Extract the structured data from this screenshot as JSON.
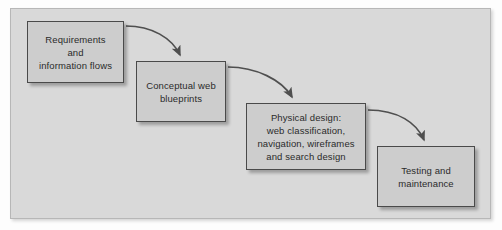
{
  "diagram": {
    "type": "flowchart",
    "frame": {
      "background_color": "#d9d9d9",
      "border_color": "#b7b7b7"
    },
    "node_style": {
      "fill_color": "#cdcdcd",
      "border_color": "#4a4a4a",
      "text_color": "#2b2b2b"
    },
    "arrow_color": "#4f4f4f",
    "nodes": [
      {
        "id": "requirements",
        "label": "Requirements\nand\ninformation flows",
        "order": 1
      },
      {
        "id": "blueprints",
        "label": "Conceptual web\nblueprints",
        "order": 2
      },
      {
        "id": "physical-design",
        "label": "Physical design:\nweb classification,\nnavigation, wireframes\nand search design",
        "order": 3
      },
      {
        "id": "testing",
        "label": "Testing and\nmaintenance",
        "order": 4
      }
    ],
    "connections": [
      {
        "id": "arrow-1",
        "from": "requirements",
        "to": "blueprints",
        "style": "curved-arrow"
      },
      {
        "id": "arrow-2",
        "from": "blueprints",
        "to": "physical-design",
        "style": "curved-arrow"
      },
      {
        "id": "arrow-3",
        "from": "physical-design",
        "to": "testing",
        "style": "curved-arrow"
      }
    ]
  }
}
